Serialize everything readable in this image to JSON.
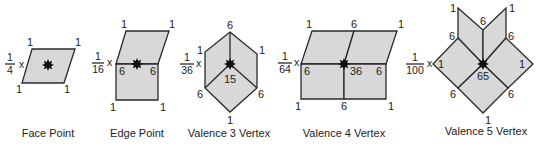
{
  "figure": {
    "colors": {
      "face_fill": "#d8d8d8",
      "stroke": "#2a2a2a",
      "text": "#222222",
      "point": "#111111"
    },
    "panels": [
      {
        "id": "face-point",
        "caption": "Face Point",
        "scale": {
          "numerator": "1",
          "denominator": "4",
          "times": "x"
        },
        "weights": [
          "1",
          "1",
          "1",
          "1"
        ]
      },
      {
        "id": "edge-point",
        "caption": "Edge Point",
        "scale": {
          "numerator": "1",
          "denominator": "16",
          "times": "x"
        },
        "weights": [
          "1",
          "1",
          "6",
          "6",
          "1",
          "1"
        ]
      },
      {
        "id": "valence-3-vertex",
        "caption": "Valence 3 Vertex",
        "scale": {
          "numerator": "1",
          "denominator": "36",
          "times": "x"
        },
        "weights": [
          "6",
          "1",
          "1",
          "15",
          "6",
          "6",
          "1"
        ]
      },
      {
        "id": "valence-4-vertex",
        "caption": "Valence 4 Vertex",
        "scale": {
          "numerator": "1",
          "denominator": "64",
          "times": "x"
        },
        "weights": [
          "1",
          "6",
          "1",
          "6",
          "36",
          "6",
          "1",
          "6",
          "1"
        ]
      },
      {
        "id": "valence-5-vertex",
        "caption": "Valence 5 Vertex",
        "scale": {
          "numerator": "1",
          "denominator": "100",
          "times": "x"
        },
        "weights": [
          "1",
          "6",
          "1",
          "6",
          "6",
          "1",
          "1",
          "65",
          "6",
          "6",
          "1"
        ]
      }
    ]
  }
}
